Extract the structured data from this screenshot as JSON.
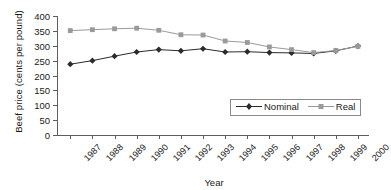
{
  "chart_data": {
    "type": "line",
    "title": "",
    "xlabel": "Year",
    "ylabel": "Beef price (cents per pound)",
    "categories": [
      "1987",
      "1988",
      "1989",
      "1990",
      "1991",
      "1992",
      "1993",
      "1994",
      "1995",
      "1996",
      "1997",
      "1998",
      "1999",
      "2000"
    ],
    "ylim": [
      0,
      400
    ],
    "yticks": [
      0,
      50,
      100,
      150,
      200,
      250,
      300,
      350,
      400
    ],
    "ytick_labels": [
      "0",
      "50",
      "100",
      "150",
      "200",
      "250",
      "300",
      "350",
      "400"
    ],
    "grid": false,
    "legend_position": "inside-lower-right",
    "series": [
      {
        "name": "Nominal",
        "color": "#2b2b2b",
        "marker": "diamond",
        "values": [
          238,
          250,
          265,
          279,
          287,
          283,
          290,
          279,
          280,
          277,
          276,
          274,
          283,
          299
        ]
      },
      {
        "name": "Real",
        "color": "#9a9a9a",
        "marker": "square",
        "values": [
          351,
          354,
          357,
          359,
          352,
          337,
          336,
          316,
          311,
          296,
          287,
          277,
          284,
          298
        ]
      }
    ]
  },
  "legend": {
    "items": [
      {
        "label": "Nominal"
      },
      {
        "label": "Real"
      }
    ]
  },
  "colors": {
    "nominal": "#2b2b2b",
    "real": "#9a9a9a",
    "axis": "#5d5d5d",
    "background": "#ffffff"
  }
}
